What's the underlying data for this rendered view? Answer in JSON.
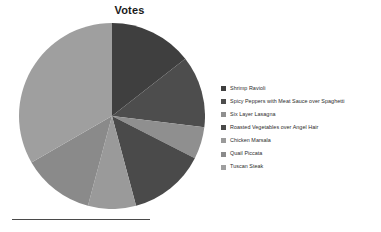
{
  "chart": {
    "title": "Votes"
  },
  "chart_data": {
    "type": "pie",
    "title": "Votes",
    "xlabel": "",
    "ylabel": "",
    "legend_position": "right",
    "grid": false,
    "categories": [
      "Shrimp Ravioli",
      "Spicy Peppers with Meat Sauce over Spaghetti",
      "Six Layer Lasagna",
      "Roasted Vegetables over Angel Hair",
      "Chicken Marsala",
      "Quail Piccata",
      "Tuscan Steak"
    ],
    "values": [
      52,
      45,
      20,
      48,
      30,
      45,
      120
    ],
    "units": "degrees",
    "slices": [
      {
        "label": "Shrimp Ravioli",
        "start_angle": 0,
        "end_angle": 52,
        "sweep": 52,
        "color": "#3f3f3f"
      },
      {
        "label": "Spicy Peppers with Meat Sauce over Spaghetti",
        "start_angle": 52,
        "end_angle": 97,
        "sweep": 45,
        "color": "#4d4d4d"
      },
      {
        "label": "Six Layer Lasagna",
        "start_angle": 97,
        "end_angle": 117,
        "sweep": 20,
        "color": "#8f8f8f"
      },
      {
        "label": "Roasted Vegetables over Angel Hair",
        "start_angle": 117,
        "end_angle": 165,
        "sweep": 48,
        "color": "#4a4a4a"
      },
      {
        "label": "Chicken Marsala",
        "start_angle": 165,
        "end_angle": 195,
        "sweep": 30,
        "color": "#9a9a9a"
      },
      {
        "label": "Quail Piccata",
        "start_angle": 195,
        "end_angle": 240,
        "sweep": 45,
        "color": "#8a8a8a"
      },
      {
        "label": "Tuscan Steak",
        "start_angle": 240,
        "end_angle": 360,
        "sweep": 120,
        "color": "#9f9f9f"
      }
    ],
    "geometry": {
      "center_x": 93,
      "center_y": 93,
      "radius": 93
    }
  },
  "legend": {
    "items": [
      {
        "label": "Shrimp Ravioli",
        "color": "#3f3f3f"
      },
      {
        "label": "Spicy Peppers with Meat Sauce over Spaghetti",
        "color": "#4d4d4d"
      },
      {
        "label": "Six Layer Lasagna",
        "color": "#8f8f8f"
      },
      {
        "label": "Roasted Vegetables over Angel Hair",
        "color": "#4a4a4a"
      },
      {
        "label": "Chicken Marsala",
        "color": "#9a9a9a"
      },
      {
        "label": "Quail Piccata",
        "color": "#8a8a8a"
      },
      {
        "label": "Tuscan Steak",
        "color": "#9f9f9f"
      }
    ]
  },
  "footer": {
    "rule_color": "#4a4a4a"
  }
}
